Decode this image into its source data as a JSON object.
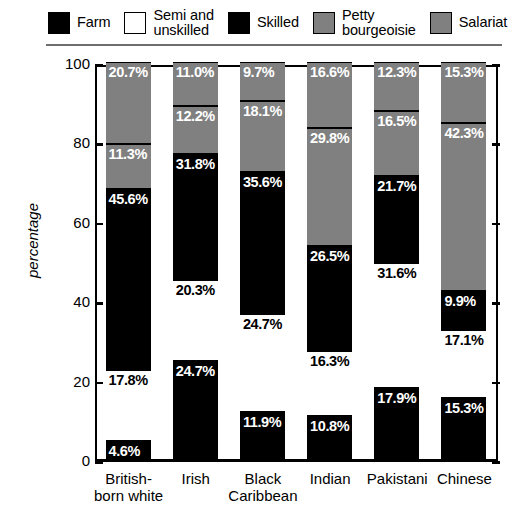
{
  "legend": {
    "items": [
      {
        "label": "Farm",
        "color": "#000000",
        "swatch_name": "legend-swatch-farm"
      },
      {
        "label": "Semi and\nunskilled",
        "color": "#ffffff",
        "swatch_name": "legend-swatch-semi-unskilled"
      },
      {
        "label": "Skilled",
        "color": "#000000",
        "swatch_name": "legend-swatch-skilled"
      },
      {
        "label": "Petty\nbourgeoisie",
        "color": "#808080",
        "swatch_name": "legend-swatch-petty-bourgeoisie"
      },
      {
        "label": "Salariat",
        "color": "#808080",
        "swatch_name": "legend-swatch-salariat"
      }
    ]
  },
  "axis": {
    "y_title": "percentage",
    "y_ticks": [
      "0",
      "20",
      "40",
      "60",
      "80",
      "100"
    ]
  },
  "chart_data": {
    "type": "bar",
    "title": "",
    "xlabel": "",
    "ylabel": "percentage",
    "ylim": [
      0,
      100
    ],
    "grid": false,
    "stacked": true,
    "stack_total": 100,
    "legend_position": "top",
    "categories": [
      "British-\nborn white",
      "Irish",
      "Black\nCaribbean",
      "Indian",
      "Pakistani",
      "Chinese"
    ],
    "series": [
      {
        "name": "Farm",
        "color": "#000000",
        "text_color": "#ffffff",
        "values": [
          4.6,
          24.7,
          11.9,
          10.8,
          17.9,
          15.3
        ],
        "labels": [
          "4.6%",
          "24.7%",
          "11.9%",
          "10.8%",
          "17.9%",
          "15.3%"
        ]
      },
      {
        "name": "Semi and unskilled",
        "color": "#ffffff",
        "text_color": "#000000",
        "values": [
          17.8,
          20.3,
          24.7,
          16.3,
          31.6,
          17.1
        ],
        "labels": [
          "17.8%",
          "20.3%",
          "24.7%",
          "16.3%",
          "31.6%",
          "17.1%"
        ]
      },
      {
        "name": "Skilled",
        "color": "#000000",
        "text_color": "#ffffff",
        "values": [
          45.6,
          31.8,
          35.6,
          26.5,
          21.7,
          9.9
        ],
        "labels": [
          "45.6%",
          "31.8%",
          "35.6%",
          "26.5%",
          "21.7%",
          "9.9%"
        ]
      },
      {
        "name": "Petty bourgeoisie",
        "color": "#808080",
        "text_color": "#ffffff",
        "values": [
          11.3,
          12.2,
          18.1,
          29.8,
          16.5,
          42.3
        ],
        "labels": [
          "11.3%",
          "12.2%",
          "18.1%",
          "29.8%",
          "16.5%",
          "42.3%"
        ]
      },
      {
        "name": "Salariat",
        "color": "#808080",
        "text_color": "#ffffff",
        "values": [
          20.7,
          11.0,
          9.7,
          16.6,
          12.3,
          15.3
        ],
        "labels": [
          "20.7%",
          "11.0%",
          "9.7%",
          "16.6%",
          "12.3%",
          "15.3%"
        ]
      }
    ]
  }
}
